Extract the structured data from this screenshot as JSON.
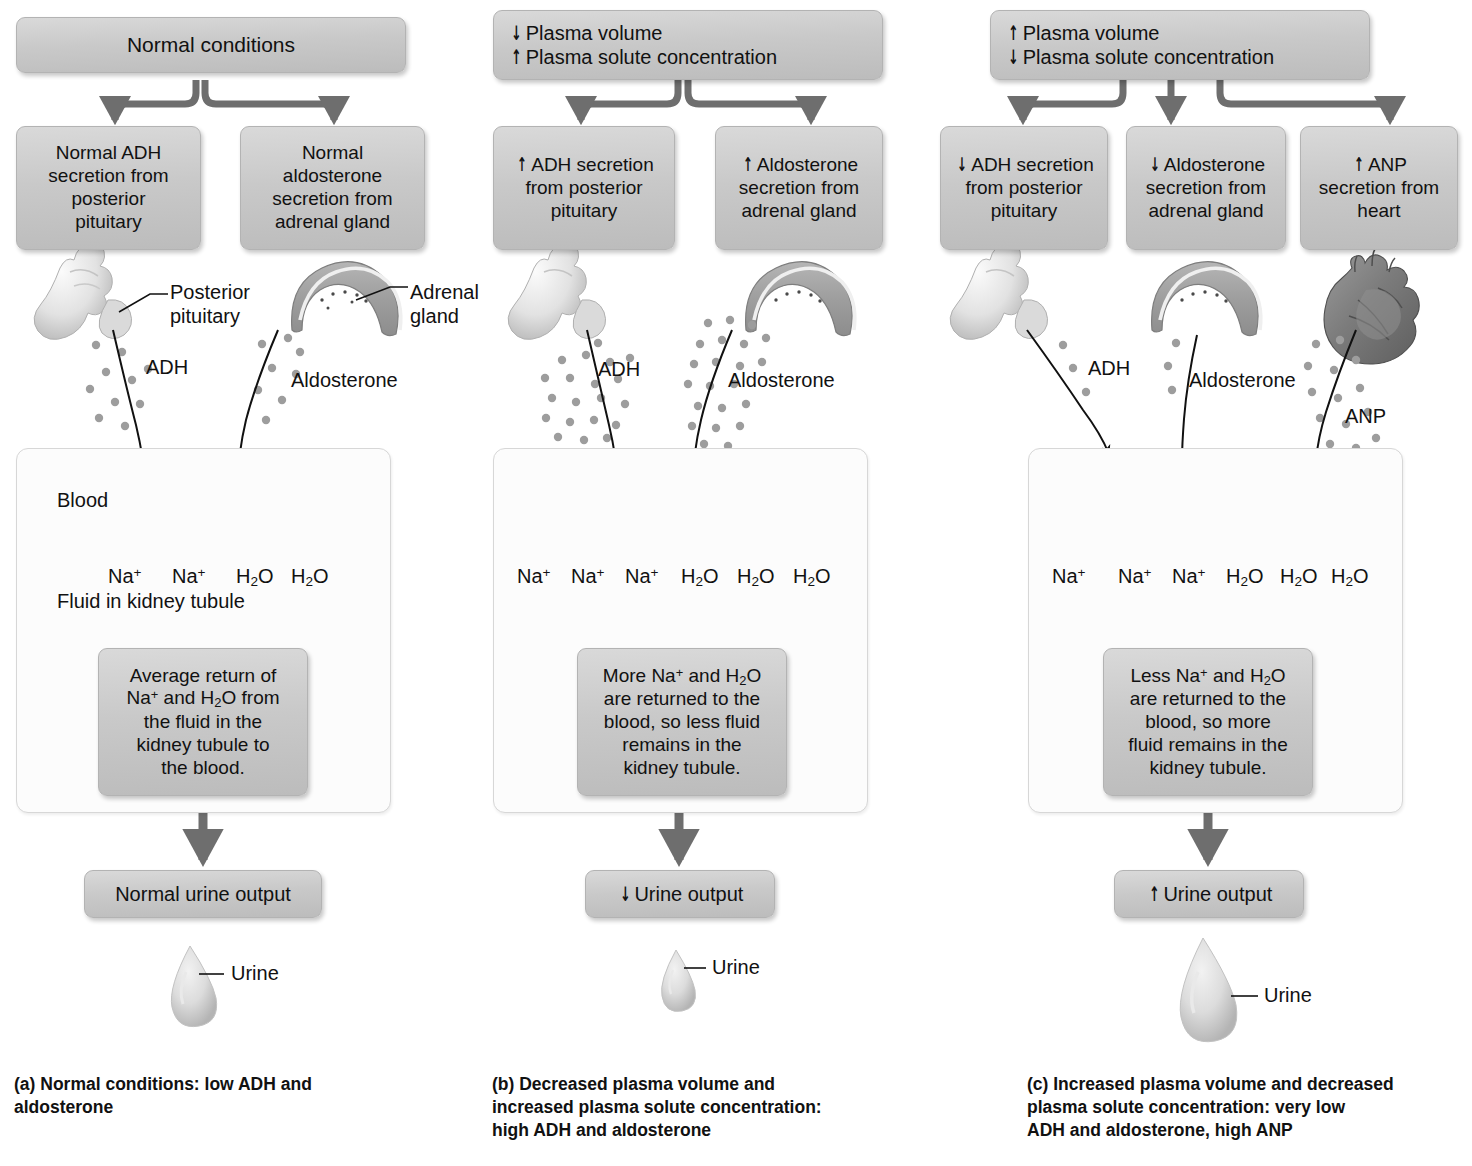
{
  "figure": {
    "na_label": "Na+",
    "h2o_label": "H2O",
    "urine_label": "Urine",
    "blood_label": "Blood",
    "tubule_label": "Fluid in kidney tubule",
    "up_arrow": "↑",
    "down_arrow": "↓"
  },
  "panels": [
    {
      "id": "a",
      "top_box_lines": [
        "Normal conditions"
      ],
      "secretion_boxes": [
        {
          "name": "adh",
          "lines": [
            "Normal ADH",
            "secretion from",
            "posterior",
            "pituitary"
          ],
          "arrow": ""
        },
        {
          "name": "aldosterone",
          "lines": [
            "Normal",
            "aldosterone",
            "secretion from",
            "adrenal gland"
          ],
          "arrow": ""
        }
      ],
      "organ_labels": [
        {
          "name": "posterior-pituitary",
          "lines": [
            "Posterior",
            "pituitary"
          ]
        },
        {
          "name": "adrenal-gland",
          "lines": [
            "Adrenal",
            "gland"
          ]
        }
      ],
      "hormone_labels": [
        "ADH",
        "Aldosterone"
      ],
      "transport": {
        "na_count": 2,
        "h2o_count": 2,
        "has_reabsorption_arrows": true
      },
      "show_vessel_labels": true,
      "explanation": [
        "Average return of",
        "Na+ and H2O from",
        "the fluid in the",
        "kidney tubule to",
        "the blood."
      ],
      "urine_box": {
        "text": "Normal urine output",
        "arrow": ""
      },
      "drop_size": "medium",
      "caption": "(a) Normal conditions: low ADH and aldosterone"
    },
    {
      "id": "b",
      "top_box_lines": [
        "Plasma volume",
        "Plasma solute concentration"
      ],
      "top_box_arrows": [
        "down",
        "up"
      ],
      "secretion_boxes": [
        {
          "name": "adh",
          "lines": [
            "ADH secretion",
            "from posterior",
            "pituitary"
          ],
          "arrow": "up"
        },
        {
          "name": "aldosterone",
          "lines": [
            "Aldosterone",
            "secretion from",
            "adrenal gland"
          ],
          "arrow": "up"
        }
      ],
      "organ_labels": [],
      "hormone_labels": [
        "ADH",
        "Aldosterone"
      ],
      "transport": {
        "na_count": 3,
        "h2o_count": 3,
        "has_reabsorption_arrows": true
      },
      "show_vessel_labels": false,
      "explanation": [
        "More Na+ and H2O",
        "are returned to the",
        "blood, so less fluid",
        "remains in the",
        "kidney tubule."
      ],
      "urine_box": {
        "text": "Urine output",
        "arrow": "down"
      },
      "drop_size": "small",
      "caption": "(b) Decreased plasma volume and increased plasma solute concentration: high ADH and aldosterone"
    },
    {
      "id": "c",
      "top_box_lines": [
        "Plasma volume",
        "Plasma solute concentration"
      ],
      "top_box_arrows": [
        "up",
        "down"
      ],
      "secretion_boxes": [
        {
          "name": "adh",
          "lines": [
            "ADH secretion",
            "from posterior",
            "pituitary"
          ],
          "arrow": "down"
        },
        {
          "name": "aldosterone",
          "lines": [
            "Aldosterone",
            "secretion from",
            "adrenal gland"
          ],
          "arrow": "down"
        },
        {
          "name": "anp",
          "lines": [
            "ANP",
            "secretion from",
            "heart"
          ],
          "arrow": "up"
        }
      ],
      "organ_labels": [],
      "hormone_labels": [
        "ADH",
        "Aldosterone",
        "ANP"
      ],
      "transport": {
        "na_count": 3,
        "h2o_count": 3,
        "has_reabsorption_arrows": false
      },
      "show_vessel_labels": false,
      "explanation": [
        "Less Na+ and H2O",
        "are returned to the",
        "blood, so more",
        "fluid remains in the",
        "kidney tubule."
      ],
      "urine_box": {
        "text": "Urine output",
        "arrow": "up"
      },
      "drop_size": "large",
      "caption": "(c) Increased plasma volume and decreased plasma solute concentration: very low ADH and aldosterone, high ANP"
    }
  ],
  "captions": [
    {
      "lines": [
        "(a) Normal conditions: low ADH and",
        "aldosterone"
      ]
    },
    {
      "lines": [
        "(b) Decreased plasma volume and",
        "increased plasma solute concentration:",
        "high ADH and aldosterone"
      ]
    },
    {
      "lines": [
        "(c) Increased plasma volume and decreased",
        "plasma solute concentration: very low",
        "ADH and aldosterone, high ANP"
      ]
    }
  ],
  "colors": {
    "box_fill": "#cccccc",
    "box_border": "#b3b3b3",
    "flow_arrow": "#6e6e6e",
    "blood_vessel": "#8a8a8a",
    "tubule": "#bdbdbd",
    "text": "#111111"
  }
}
